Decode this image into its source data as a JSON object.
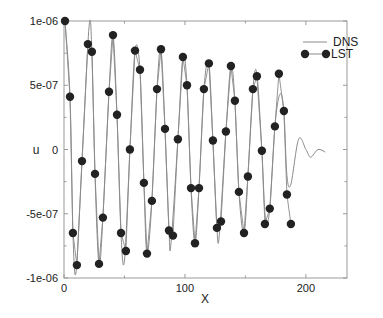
{
  "chart_data": {
    "type": "line",
    "title": "",
    "xlabel": "X",
    "ylabel": "u",
    "xlim": [
      0,
      234
    ],
    "ylim": [
      -1e-06,
      1e-06
    ],
    "grid": false,
    "legend_position": "upper right",
    "x_ticks": [
      0,
      100,
      200
    ],
    "x_tick_labels": [
      "0",
      "100",
      "200"
    ],
    "y_ticks": [
      1e-06,
      5e-07,
      0,
      -5e-07,
      -1e-06
    ],
    "y_tick_labels": [
      "1e-06",
      "5e-07",
      "0",
      "-5e-07",
      "-1e-06"
    ],
    "series": [
      {
        "name": "DNS",
        "style": "thin gray line",
        "color": "#8a8a8a",
        "x": [
          0.8,
          5,
          7.4,
          10.0,
          14.9,
          20.7,
          23.1,
          25.6,
          28.9,
          32.2,
          37.2,
          40.5,
          43.8,
          47.1,
          50.0,
          54.5,
          58.7,
          62.8,
          66.1,
          68.6,
          72.7,
          76.9,
          80.2,
          83.5,
          86.8,
          88.5,
          94.2,
          98.3,
          101.7,
          105,
          108.3,
          111.6,
          115.7,
          119.8,
          123.1,
          126.4,
          128.5,
          133.9,
          138,
          141.3,
          144.6,
          148.8,
          152.1,
          156.2,
          159.5,
          163.6,
          166.5,
          170.2,
          174.4,
          178.5,
          181.8,
          184.3,
          187.6,
          194,
          200,
          204,
          210,
          216
        ],
        "values": [
          1e-06,
          4.1e-07,
          -6.5e-07,
          -9.5e-07,
          -9e-08,
          9.5e-07,
          7.6e-07,
          -1.9e-07,
          -8.9e-07,
          -5.3e-07,
          4.5e-07,
          8.9e-07,
          2.7e-07,
          -6.5e-07,
          -8.6e-07,
          0,
          7.7e-07,
          6.2e-07,
          -2.6e-07,
          -8.1e-07,
          -4e-07,
          4.7e-07,
          7.8e-07,
          1.6e-07,
          -6.3e-07,
          -7.3e-07,
          8e-08,
          7.2e-07,
          5e-07,
          -3e-07,
          -7.3e-07,
          -3e-07,
          4.7e-07,
          6.7e-07,
          7e-08,
          -6.1e-07,
          -6.6e-07,
          1.4e-07,
          6.5e-07,
          3.8e-07,
          -3.3e-07,
          -6.5e-07,
          -2.1e-07,
          4.7e-07,
          5.9e-07,
          -1e-08,
          -5.3e-07,
          -4.6e-07,
          1.8e-07,
          4.3e-07,
          3e-07,
          -2e-07,
          -2.7e-07,
          8e-08,
          0,
          -6e-08,
          0,
          -2e-08
        ]
      },
      {
        "name": "LST",
        "style": "filled circle markers with gray line",
        "color": "#222222",
        "x": [
          0.8,
          5,
          7.4,
          10.7,
          14.9,
          19.8,
          23.1,
          25.6,
          28.9,
          32.2,
          37.2,
          40.5,
          43.8,
          47.1,
          51.2,
          54.5,
          58.7,
          62.8,
          66.1,
          68.6,
          72.7,
          76.9,
          80.2,
          83.5,
          86.8,
          90.1,
          94.2,
          98.3,
          101.7,
          105,
          108.3,
          111.6,
          115.7,
          119.8,
          123.1,
          126.4,
          129.8,
          133.9,
          138,
          141.3,
          144.6,
          148.8,
          152.1,
          156.2,
          159.5,
          163.6,
          166.1,
          170.2,
          174.4,
          177.7,
          181.8,
          184.3,
          187.6
        ],
        "values": [
          1e-06,
          4.1e-07,
          -6.5e-07,
          -9e-07,
          -9e-08,
          8.2e-07,
          7.6e-07,
          -1.9e-07,
          -8.9e-07,
          -5.3e-07,
          4.5e-07,
          8.9e-07,
          2.7e-07,
          -6.5e-07,
          -7.9e-07,
          0,
          7.7e-07,
          6.2e-07,
          -2.6e-07,
          -8.1e-07,
          -4e-07,
          4.7e-07,
          7.8e-07,
          1.6e-07,
          -6.3e-07,
          -6.7e-07,
          8e-08,
          7.2e-07,
          5e-07,
          -3e-07,
          -7.3e-07,
          -3e-07,
          4.7e-07,
          6.7e-07,
          7e-08,
          -6.1e-07,
          -5.6e-07,
          1.4e-07,
          6.5e-07,
          3.8e-07,
          -3.3e-07,
          -6.5e-07,
          -2.1e-07,
          4.7e-07,
          5.7e-07,
          -1e-08,
          -5.8e-07,
          -4.6e-07,
          1.8e-07,
          5.9e-07,
          3e-07,
          -3.5e-07,
          -5.8e-07
        ]
      }
    ]
  },
  "legend": {
    "items": [
      {
        "label": "DNS"
      },
      {
        "label": "LST"
      }
    ]
  }
}
